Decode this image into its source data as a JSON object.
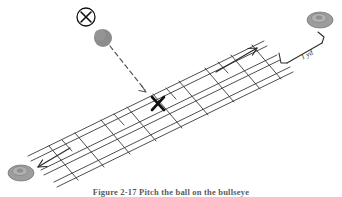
{
  "figure": {
    "caption": "Figure 2-17 Pitch the ball on the bullseye",
    "alt_title": "Agility ladder drill with pitched ball target",
    "background_color": "#ffffff",
    "line_color": "#3a3a3a",
    "ink_color": "#1a1a1a",
    "disc_color": "#9a9a9a",
    "disc_shadow_color": "#7c7c7c",
    "ball_color": "#8c8c8c"
  },
  "labels": {
    "distance": "1 yd",
    "target_mark": "X",
    "thrower_mark": "X"
  },
  "elements": {
    "ladder_name": "agility-ladder",
    "ball_name": "gray-ball",
    "trajectory_name": "dashed-trajectory-arrow",
    "target_name": "target-x-mark",
    "thrower_name": "circled-x-thrower",
    "disc_top_name": "disc-marker-top-right",
    "disc_bottom_name": "disc-marker-bottom-left",
    "arrow_up_name": "ladder-direction-arrow-up",
    "arrow_down_name": "ladder-direction-arrow-down",
    "bracket_name": "distance-bracket"
  }
}
